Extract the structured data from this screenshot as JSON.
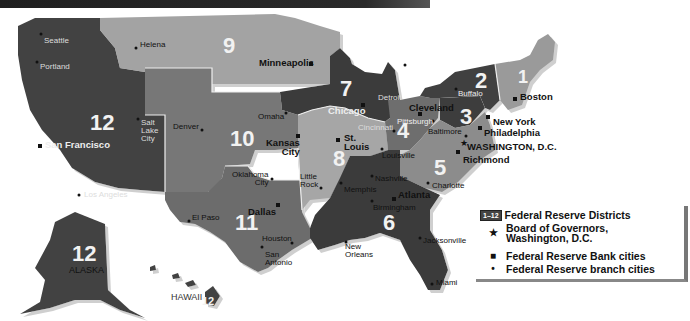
{
  "map": {
    "title": "Federal Reserve Districts",
    "districts": [
      {
        "id": "1",
        "label": "1",
        "color": "#9a9a9a"
      },
      {
        "id": "2",
        "label": "2",
        "color": "#3f3f3f"
      },
      {
        "id": "3",
        "label": "3",
        "color": "#3c3c3c"
      },
      {
        "id": "4",
        "label": "4",
        "color": "#6e6e6e"
      },
      {
        "id": "5",
        "label": "5",
        "color": "#8c8c8c"
      },
      {
        "id": "6",
        "label": "6",
        "color": "#3a3a3a"
      },
      {
        "id": "7",
        "label": "7",
        "color": "#3a3a3a"
      },
      {
        "id": "8",
        "label": "8",
        "color": "#a6a6a6"
      },
      {
        "id": "9",
        "label": "9",
        "color": "#a3a3a3"
      },
      {
        "id": "10",
        "label": "10",
        "color": "#767676"
      },
      {
        "id": "11",
        "label": "11",
        "color": "#6c6c6c"
      },
      {
        "id": "12",
        "label": "12",
        "color": "#434343"
      },
      {
        "id": "12-alaska",
        "label": "12",
        "color": "#434343"
      },
      {
        "id": "12-hawaii",
        "label": "12",
        "color": "#434343"
      }
    ],
    "state_labels": {
      "alaska": "ALASKA",
      "hawaii": "HAWAII"
    },
    "bank_cities": [
      "Boston",
      "New York",
      "Philadelphia",
      "Cleveland",
      "Richmond",
      "Atlanta",
      "Chicago",
      "St. Louis",
      "Minneapolis",
      "Kansas City",
      "Dallas",
      "San Francisco"
    ],
    "board_city": "WASHINGTON, D.C.",
    "branch_cities": [
      "Seattle",
      "Portland",
      "Helena",
      "Salt Lake City",
      "Los Angeles",
      "Denver",
      "Omaha",
      "Oklahoma City",
      "El Paso",
      "Houston",
      "San Antonio",
      "Little Rock",
      "Memphis",
      "Louisville",
      "Nashville",
      "Birmingham",
      "New Orleans",
      "Jacksonville",
      "Miami",
      "Charlotte",
      "Baltimore",
      "Pittsburgh",
      "Cincinnati",
      "Detroit",
      "Buffalo"
    ],
    "labels": {
      "seattle": "Seattle",
      "portland": "Portland",
      "helena": "Helena",
      "minneapolis": "Minneapolis",
      "san_francisco": "San Francisco",
      "salt_lake_city": "Salt\nLake\nCity",
      "los_angeles": "Los Angeles",
      "denver": "Denver",
      "omaha": "Omaha",
      "kansas_city": "Kansas\nCity",
      "oklahoma_city": "Oklahoma\nCity",
      "el_paso": "El Paso",
      "dallas": "Dallas",
      "houston": "Houston",
      "san_antonio": "San\nAntonio",
      "little_rock": "Little\nRock",
      "memphis": "Memphis",
      "st_louis": "St.\nLouis",
      "louisville": "Louisville",
      "chicago": "Chicago",
      "detroit": "Detroit",
      "cincinnati": "Cincinnati",
      "cleveland": "Cleveland",
      "pittsburgh": "Pittsburgh",
      "buffalo": "Buffalo",
      "boston": "Boston",
      "new_york": "New York",
      "philadelphia": "Philadelphia",
      "baltimore": "Baltimore",
      "washington": "WASHINGTON, D.C.",
      "richmond": "Richmond",
      "charlotte": "Charlotte",
      "nashville": "Nashville",
      "atlanta": "Atlanta",
      "birmingham": "Birmingham",
      "new_orleans": "New\nOrleans",
      "jacksonville": "Jacksonville",
      "miami": "Miami"
    }
  },
  "legend": {
    "badge": "1–12",
    "items": [
      {
        "symbol": "badge",
        "label": "Federal Reserve Districts"
      },
      {
        "symbol": "★",
        "label": "Board of Governors,\nWashington, D.C."
      },
      {
        "symbol": "■",
        "label": "Federal Reserve Bank cities"
      },
      {
        "symbol": "•",
        "label": "Federal Reserve branch cities"
      }
    ]
  }
}
